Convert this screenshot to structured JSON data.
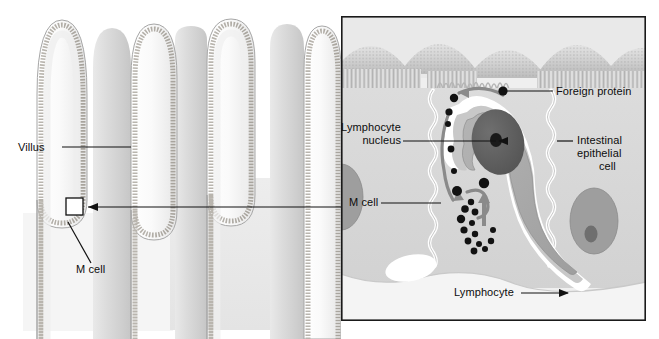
{
  "figure": {
    "title_text": "",
    "domain": "biology-diagram"
  },
  "left_panel": {
    "name": "villi-overview",
    "labels": {
      "villus": "Villus",
      "m_cell": "M cell"
    },
    "callout_box": {
      "name": "magnified-region-box",
      "x": 66,
      "y": 198,
      "width": 17,
      "height": 17
    },
    "villi_count": 9,
    "colors": {
      "villus_fill": "#f2f2f2",
      "villus_solid": "#d8d8d8",
      "epithelium_band": "#b0aca6",
      "outline": "#9a9a9a",
      "background_block": "#ececec"
    }
  },
  "right_panel": {
    "name": "m-cell-detail",
    "border_color": "#1a1a1a",
    "labels": {
      "foreign_protein": "Foreign protein",
      "lymphocyte_nucleus_line1": "Lymphocyte",
      "lymphocyte_nucleus_line2": "nucleus",
      "intestinal_epithelial_line1": "Intestinal",
      "intestinal_epithelial_line2": "epithelial",
      "intestinal_epithelial_line3": "cell",
      "m_cell": "M cell",
      "lymphocyte": "Lymphocyte"
    },
    "colors": {
      "epithelium_fill": "#d6d6d6",
      "cell_membrane": "#ffffff",
      "lymphocyte_body": "#a8a8a8",
      "lymphocyte_cytoplasm": "#c4c4c4",
      "nucleus": "#5e5e5e",
      "nucleolus": "#1c1c1c",
      "epithelial_nucleus": "#9a9a9a",
      "epithelial_nucleolus": "#6d6d6d",
      "vesicle": "#111111",
      "arrow": "#8a8a8a",
      "dome_surface": "#c9c9c9",
      "microvilli": "#bdbdbd",
      "leader_line": "#111111"
    },
    "vesicle_count_upper_path": 5,
    "vesicle_count_pocket_cluster": 11,
    "vesicle_count_lower_path": 7
  },
  "connector": {
    "name": "magnification-connector",
    "description": "arrow from right panel left edge to the callout box on the left panel",
    "color": "#111111"
  }
}
